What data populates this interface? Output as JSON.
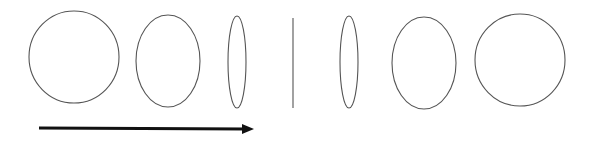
{
  "diagram": {
    "stroke_color": "#555555",
    "arrow_color": "#111111",
    "shapes": [
      {
        "type": "ellipse",
        "name": "circle-1",
        "cx": 74,
        "cy": 57,
        "rx": 45,
        "ry": 46
      },
      {
        "type": "ellipse",
        "name": "ellipse-2",
        "cx": 168,
        "cy": 61,
        "rx": 32,
        "ry": 46
      },
      {
        "type": "ellipse",
        "name": "thin-ellipse-3",
        "cx": 237,
        "cy": 62,
        "rx": 9,
        "ry": 46
      },
      {
        "type": "line",
        "name": "line-4",
        "x1": 293,
        "y1": 18,
        "x2": 293,
        "y2": 108
      },
      {
        "type": "ellipse",
        "name": "thin-ellipse-5",
        "cx": 349,
        "cy": 62,
        "rx": 9,
        "ry": 46
      },
      {
        "type": "ellipse",
        "name": "ellipse-6",
        "cx": 424,
        "cy": 63,
        "rx": 32,
        "ry": 46
      },
      {
        "type": "ellipse",
        "name": "circle-7",
        "cx": 520,
        "cy": 60,
        "rx": 45,
        "ry": 46
      }
    ],
    "arrow": {
      "x1": 39,
      "y1": 128,
      "x2": 254,
      "y2": 129,
      "direction": "right"
    }
  }
}
